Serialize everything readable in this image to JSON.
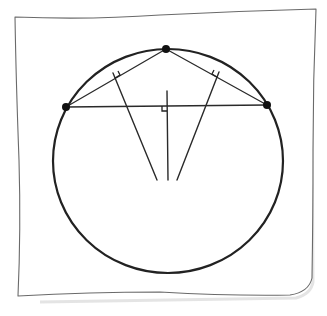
{
  "diagram": {
    "paper": {
      "corners": [
        [
          15,
          17
        ],
        [
          316,
          9
        ],
        [
          312,
          282
        ],
        [
          18,
          296
        ]
      ],
      "stroke_color": "#6a6a6a"
    },
    "circle": {
      "center": [
        168,
        161
      ],
      "rx": 115,
      "ry": 112,
      "stroke_color": "#222222"
    },
    "points": [
      {
        "name": "left-point",
        "x": 66,
        "y": 107
      },
      {
        "name": "top-point",
        "x": 166,
        "y": 49
      },
      {
        "name": "right-point",
        "x": 267,
        "y": 105
      }
    ],
    "chords": [
      {
        "name": "chord-left-top",
        "from": [
          66,
          107
        ],
        "to": [
          166,
          49
        ]
      },
      {
        "name": "chord-top-right",
        "from": [
          166,
          49
        ],
        "to": [
          267,
          105
        ]
      },
      {
        "name": "chord-left-right",
        "from": [
          66,
          107
        ],
        "to": [
          267,
          105
        ]
      }
    ],
    "bisectors": [
      {
        "name": "bisector-left-top",
        "from": [
          113,
          73
        ],
        "to": [
          157,
          180
        ]
      },
      {
        "name": "bisector-top-right",
        "from": [
          219,
          72
        ],
        "to": [
          177,
          180
        ]
      },
      {
        "name": "bisector-left-right",
        "from": [
          167,
          91
        ],
        "to": [
          168,
          180
        ]
      }
    ],
    "intersection": {
      "x": 167,
      "y": 161
    },
    "right_angle_marks": 3
  }
}
